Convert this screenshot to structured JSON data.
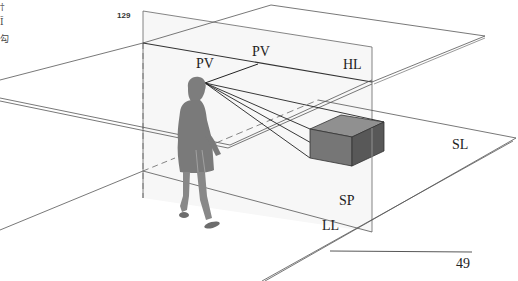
{
  "figure": {
    "number": "129",
    "page_number": "49",
    "margin_glyphs": [
      "†",
      "Ī",
      "勾"
    ],
    "labels": {
      "pv_left": "PV",
      "pv_top": "PV",
      "horizon_line": "HL",
      "station_line": "SL",
      "picture_plane": "SP",
      "ground_line": "LL"
    }
  },
  "colors": {
    "line": "#555555",
    "figure_gray": "#7a7a7a",
    "box_top": "#8e8e8e",
    "box_front": "#727272",
    "box_side": "#5a5a5a",
    "plane_shade": "#f4f4f4"
  }
}
